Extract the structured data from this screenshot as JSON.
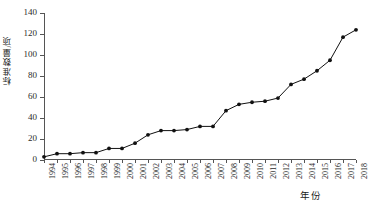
{
  "chart_data": {
    "type": "line",
    "title": "",
    "subtitle": "",
    "xlabel": "年份",
    "ylabel": "标准数量/项",
    "legend": [],
    "legend_position": "none",
    "grid": false,
    "xlim": [
      1994,
      2018
    ],
    "ylim": [
      0,
      140
    ],
    "ytick_step": 20,
    "yticks": [
      0,
      20,
      40,
      60,
      80,
      100,
      120,
      140
    ],
    "ytick_labels": [
      "0",
      "20",
      "40",
      "60",
      "80",
      "100",
      "120",
      "140"
    ],
    "categories": [
      "1994",
      "1995",
      "1996",
      "1997",
      "1998",
      "1999",
      "2000",
      "2001",
      "2002",
      "2003",
      "2004",
      "2005",
      "2006",
      "2007",
      "2008",
      "2009",
      "2010",
      "2011",
      "2012",
      "2013",
      "2014",
      "2015",
      "2016",
      "2017",
      "2018"
    ],
    "x": [
      1994,
      1995,
      1996,
      1997,
      1998,
      1999,
      2000,
      2001,
      2002,
      2003,
      2004,
      2005,
      2006,
      2007,
      2008,
      2009,
      2010,
      2011,
      2012,
      2013,
      2014,
      2015,
      2016,
      2017,
      2018
    ],
    "values": [
      3,
      6,
      6,
      7,
      7,
      11,
      11,
      16,
      24,
      28,
      28,
      29,
      32,
      32,
      47,
      53,
      55,
      56,
      59,
      72,
      77,
      85,
      95,
      117,
      124
    ],
    "marker": "filled-circle",
    "line_color": "#111111",
    "marker_color": "#111111",
    "annotations": []
  }
}
